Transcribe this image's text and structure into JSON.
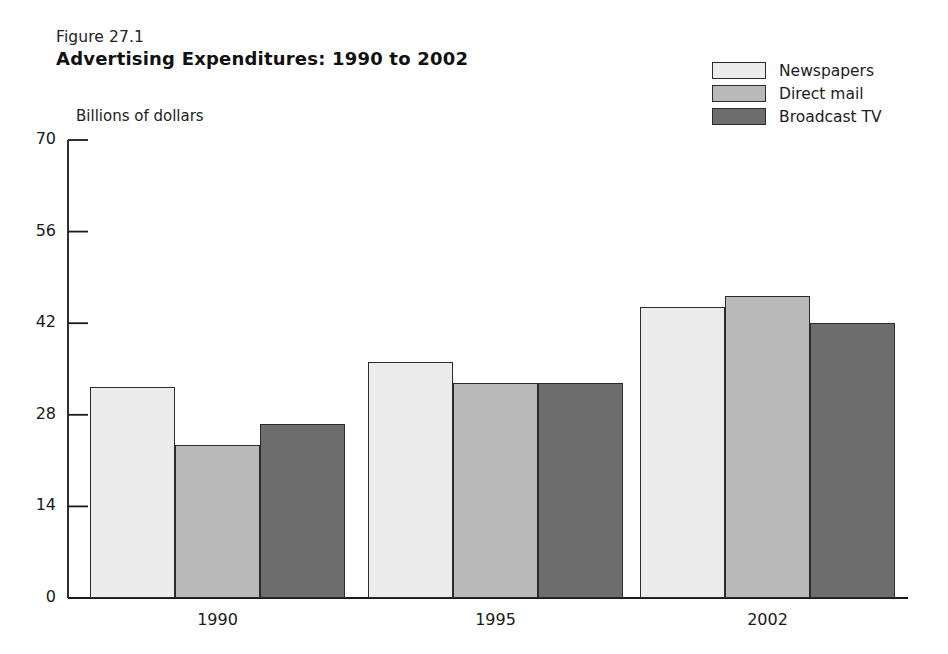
{
  "figure": {
    "caption": "Figure 27.1",
    "title": "Advertising Expenditures: 1990 to 2002"
  },
  "colors": {
    "newspapers": "#ececec",
    "direct_mail": "#b9b9b9",
    "broadcast_tv": "#6d6d6d",
    "outline": "#2b2b2b",
    "text": "#1a1a1a",
    "background": "#ffffff"
  },
  "legend": {
    "position": "top-right",
    "entries": [
      {
        "label": "Newspapers",
        "color": "#ececec"
      },
      {
        "label": "Direct mail",
        "color": "#b9b9b9"
      },
      {
        "label": "Broadcast TV",
        "color": "#6d6d6d"
      }
    ]
  },
  "chart_data": {
    "type": "bar",
    "title": "Advertising Expenditures: 1990 to 2002",
    "subtitle": "Figure 27.1",
    "xlabel": "",
    "ylabel": "Billions of dollars",
    "categories": [
      "1990",
      "1995",
      "2002"
    ],
    "series": [
      {
        "name": "Newspapers",
        "values": [
          32.3,
          36.1,
          44.5
        ]
      },
      {
        "name": "Direct mail",
        "values": [
          23.4,
          32.9,
          46.2
        ]
      },
      {
        "name": "Broadcast TV",
        "values": [
          26.6,
          32.9,
          42.0
        ]
      }
    ],
    "ylim": [
      0,
      70
    ],
    "yticks": [
      0,
      14,
      28,
      42,
      56,
      70
    ],
    "ytick_labels": [
      "0",
      "14",
      "28",
      "42",
      "56",
      "70"
    ],
    "xtick_labels": [
      "1990",
      "1995",
      "2002"
    ],
    "grid": false,
    "legend_position": "top-right"
  }
}
